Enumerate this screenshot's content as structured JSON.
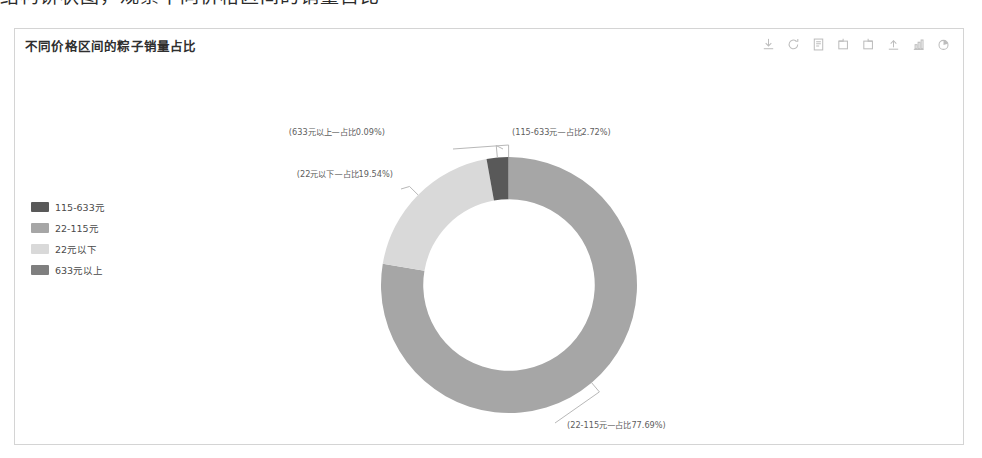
{
  "page": {
    "top_cut_text": "结构饼状图，观察不同价格区间的销量占比"
  },
  "panel": {
    "title": "不同价格区间的粽子销量占比",
    "toolbar": [
      {
        "name": "download-icon",
        "tooltip": "下载"
      },
      {
        "name": "refresh-icon",
        "tooltip": "刷新"
      },
      {
        "name": "data-view-icon",
        "tooltip": "数据视图"
      },
      {
        "name": "restore-icon",
        "tooltip": "还原"
      },
      {
        "name": "zoom-area-icon",
        "tooltip": "区域缩放"
      },
      {
        "name": "export-icon",
        "tooltip": "导出"
      },
      {
        "name": "bar-chart-icon",
        "tooltip": "切换为柱状图"
      },
      {
        "name": "pie-chart-icon",
        "tooltip": "切换为饼图"
      }
    ]
  },
  "legend": {
    "items": [
      {
        "label": "115-633元",
        "color": "#595959"
      },
      {
        "label": "22-115元",
        "color": "#a6a6a6"
      },
      {
        "label": "22元以下",
        "color": "#d9d9d9"
      },
      {
        "label": "633元以上",
        "color": "#7f7f7f"
      }
    ]
  },
  "chart_data": {
    "type": "pie",
    "title": "不同价格区间的粽子销量占比",
    "subtitle": "",
    "xlabel": "",
    "ylabel": "",
    "donut": true,
    "inner_radius_ratio": 0.67,
    "legend_position": "left",
    "grid": false,
    "categories": [
      "22-115元",
      "22元以下",
      "115-633元",
      "633元以上"
    ],
    "values": [
      77.69,
      19.54,
      2.72,
      0.09
    ],
    "unit": "%",
    "slices": [
      {
        "name": "22-115元",
        "value": 77.69,
        "color": "#a6a6a6",
        "legend_label": "22-115元",
        "data_label": "(22-115元—占比77.69%)"
      },
      {
        "name": "22元以下",
        "value": 19.54,
        "color": "#d9d9d9",
        "legend_label": "22元以下",
        "data_label": "(22元以下—占比19.54%)"
      },
      {
        "name": "115-633元",
        "value": 2.72,
        "color": "#595959",
        "legend_label": "115-633元",
        "data_label": "(115-633元—占比2.72%)"
      },
      {
        "name": "633元以上",
        "value": 0.09,
        "color": "#7f7f7f",
        "legend_label": "633元以上",
        "data_label": "(633元以上—占比0.09%)"
      }
    ],
    "labels": {
      "top_left": "(633元以上—占比0.09%)",
      "top_right": "(115-633元—占比2.72%)",
      "left": "(22元以下—占比19.54%)",
      "bottom_right": "(22-115元—占比77.69%)"
    }
  }
}
